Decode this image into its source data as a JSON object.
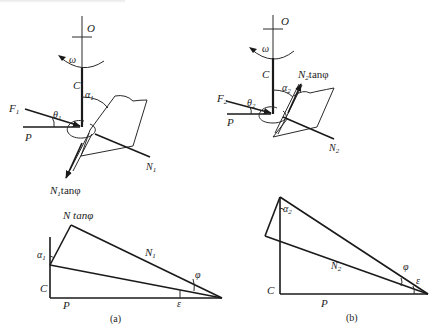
{
  "figure": {
    "panels": [
      {
        "id": "a",
        "caption": "(a)",
        "top": {
          "axis_label_O": "O",
          "rotation_label": "ω",
          "axis_label_C": "C",
          "force_F": "F",
          "force_F_sub": "1",
          "angle_theta": "θ",
          "angle_theta_sub": "1",
          "angle_alpha": "α",
          "angle_alpha_sub": "1",
          "label_P": "P",
          "normal_N": "N",
          "normal_N_sub": "1",
          "friction_label": "N",
          "friction_label_sub": "1",
          "friction_label_suffix": "tanφ"
        },
        "bottom": {
          "apex_label": "N tanφ",
          "hyp_label": "N",
          "hyp_label_sub": "1",
          "angle_alpha": "α",
          "angle_alpha_sub": "1",
          "label_C": "C",
          "label_P": "P",
          "angle_phi": "φ",
          "angle_eps": "ε"
        }
      },
      {
        "id": "b",
        "caption": "(b)",
        "top": {
          "axis_label_O": "O",
          "rotation_label": "ω",
          "axis_label_C": "C",
          "force_F": "F",
          "force_F_sub": "2",
          "angle_theta": "θ",
          "angle_theta_sub": "2",
          "angle_alpha": "α",
          "angle_alpha_sub": "2",
          "label_P": "P",
          "normal_N": "N",
          "normal_N_sub": "2",
          "friction_label": "N",
          "friction_label_sub": "2",
          "friction_label_suffix": "tanφ"
        },
        "bottom": {
          "hyp_label": "N",
          "hyp_label_sub": "2",
          "angle_alpha": "α",
          "angle_alpha_sub": "2",
          "label_C": "C",
          "label_P": "P",
          "angle_phi": "φ",
          "angle_eps": "ε"
        }
      }
    ]
  }
}
